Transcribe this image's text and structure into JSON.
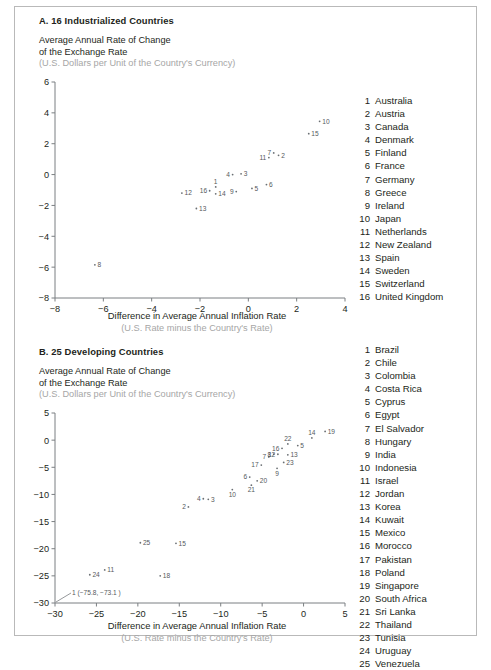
{
  "figure": {
    "panels": [
      {
        "id": "A",
        "title": "A. 16 Industrialized Countries",
        "ylabel_line1": "Average Annual Rate of Change",
        "ylabel_line2": "of the Exchange Rate",
        "ylabel_sub": "(U.S. Dollars per Unit of the Country's Currency)",
        "xlabel": "Difference in Average Annual Inflation Rate",
        "xlabel_sub": "(U.S. Rate minus the Country's Rate)"
      },
      {
        "id": "B",
        "title": "B. 25 Developing Countries",
        "ylabel_line1": "Average Annual Rate of Change",
        "ylabel_line2": "of the Exchange Rate",
        "ylabel_sub": "(U.S. Dollars per Unit of the Country's Currency)",
        "xlabel": "Difference in Average Annual Inflation Rate",
        "xlabel_sub": "(U.S. Rate minus the Country's Rate)"
      }
    ]
  },
  "chart_data": [
    {
      "type": "scatter",
      "title": "A. 16 Industrialized Countries",
      "xlabel": "Difference in Average Annual Inflation Rate",
      "xlabel_sub": "(U.S. Rate minus the Country's Rate)",
      "ylabel": "Average Annual Rate of Change of the Exchange Rate",
      "ylabel_sub": "(U.S. Dollars per Unit of the Country's Currency)",
      "xlim": [
        -8,
        4
      ],
      "ylim": [
        -8,
        6
      ],
      "xticks": [
        -8,
        -6,
        -4,
        -2,
        0,
        2,
        4
      ],
      "yticks": [
        -8,
        -6,
        -4,
        -2,
        0,
        2,
        4,
        6
      ],
      "grid": false,
      "legend_position": "right",
      "points": [
        {
          "id": 1,
          "name": "Australia",
          "x": -1.35,
          "y": -0.8,
          "label_pos": "above"
        },
        {
          "id": 2,
          "name": "Austria",
          "x": 1.25,
          "y": 1.25,
          "label_pos": "right"
        },
        {
          "id": 3,
          "name": "Canada",
          "x": -0.3,
          "y": 0.05,
          "label_pos": "right"
        },
        {
          "id": 4,
          "name": "Denmark",
          "x": -0.65,
          "y": 0.0,
          "label_pos": "left"
        },
        {
          "id": 5,
          "name": "Finland",
          "x": 0.15,
          "y": -0.9,
          "label_pos": "right"
        },
        {
          "id": 6,
          "name": "France",
          "x": 0.75,
          "y": -0.65,
          "label_pos": "right"
        },
        {
          "id": 7,
          "name": "Germany",
          "x": 1.05,
          "y": 1.4,
          "label_pos": "left"
        },
        {
          "id": 8,
          "name": "Greece",
          "x": -6.35,
          "y": -5.85,
          "label_pos": "right"
        },
        {
          "id": 9,
          "name": "Ireland",
          "x": -0.5,
          "y": -1.1,
          "label_pos": "left"
        },
        {
          "id": 10,
          "name": "Japan",
          "x": 2.95,
          "y": 3.45,
          "label_pos": "right"
        },
        {
          "id": 11,
          "name": "Netherlands",
          "x": 0.85,
          "y": 1.1,
          "label_pos": "left"
        },
        {
          "id": 12,
          "name": "New Zealand",
          "x": -2.75,
          "y": -1.2,
          "label_pos": "right"
        },
        {
          "id": 13,
          "name": "Spain",
          "x": -2.15,
          "y": -2.2,
          "label_pos": "right"
        },
        {
          "id": 14,
          "name": "Sweden",
          "x": -1.35,
          "y": -1.25,
          "label_pos": "right"
        },
        {
          "id": 15,
          "name": "Switzerland",
          "x": 2.5,
          "y": 2.65,
          "label_pos": "right"
        },
        {
          "id": 16,
          "name": "United Kingdom",
          "x": -1.6,
          "y": -1.05,
          "label_pos": "left"
        }
      ]
    },
    {
      "type": "scatter",
      "title": "B. 25 Developing Countries",
      "xlabel": "Difference in Average Annual Inflation Rate",
      "xlabel_sub": "(U.S. Rate minus the Country's Rate)",
      "ylabel": "Average Annual Rate of Change of the Exchange Rate",
      "ylabel_sub": "(U.S. Dollars per Unit of the Country's Currency)",
      "xlim": [
        -30,
        5
      ],
      "ylim": [
        -30,
        5
      ],
      "xticks": [
        -30,
        -25,
        -20,
        -15,
        -10,
        -5,
        0,
        5
      ],
      "yticks": [
        -30,
        -25,
        -20,
        -15,
        -10,
        -5,
        0,
        5
      ],
      "grid": false,
      "legend_position": "right",
      "annotation": {
        "text": "1 (−75.8, −73.1 )",
        "target_x": -30,
        "target_y": -30
      },
      "points": [
        {
          "id": 1,
          "name": "Brazil",
          "x": -30.0,
          "y": -30.0,
          "label_pos": "offscreen"
        },
        {
          "id": 2,
          "name": "Chile",
          "x": -13.9,
          "y": -12.3,
          "label_pos": "left"
        },
        {
          "id": 3,
          "name": "Colombia",
          "x": -11.5,
          "y": -10.9,
          "label_pos": "right"
        },
        {
          "id": 4,
          "name": "Costa Rica",
          "x": -12.1,
          "y": -10.8,
          "label_pos": "left"
        },
        {
          "id": 5,
          "name": "Cyprus",
          "x": -0.7,
          "y": -1.0,
          "label_pos": "right"
        },
        {
          "id": 6,
          "name": "Egypt",
          "x": -6.5,
          "y": -6.8,
          "label_pos": "left"
        },
        {
          "id": 7,
          "name": "El Salvador",
          "x": -4.2,
          "y": -3.1,
          "label_pos": "left"
        },
        {
          "id": 8,
          "name": "Hungary",
          "x": -3.6,
          "y": -2.6,
          "label_pos": "left"
        },
        {
          "id": 9,
          "name": "India",
          "x": -3.2,
          "y": -5.2,
          "label_pos": "below"
        },
        {
          "id": 10,
          "name": "Indonesia",
          "x": -8.6,
          "y": -9.1,
          "label_pos": "below"
        },
        {
          "id": 11,
          "name": "Israel",
          "x": -24.0,
          "y": -23.9,
          "label_pos": "right"
        },
        {
          "id": 12,
          "name": "Jordan",
          "x": -3.1,
          "y": -2.6,
          "label_pos": "left"
        },
        {
          "id": 13,
          "name": "Korea",
          "x": -1.9,
          "y": -2.7,
          "label_pos": "right"
        },
        {
          "id": 14,
          "name": "Kuwait",
          "x": 1.0,
          "y": 0.4,
          "label_pos": "above"
        },
        {
          "id": 15,
          "name": "Mexico",
          "x": -15.4,
          "y": -19.0,
          "label_pos": "right"
        },
        {
          "id": 16,
          "name": "Morocco",
          "x": -2.6,
          "y": -1.5,
          "label_pos": "left"
        },
        {
          "id": 17,
          "name": "Pakistan",
          "x": -5.1,
          "y": -4.6,
          "label_pos": "left"
        },
        {
          "id": 18,
          "name": "Poland",
          "x": -17.3,
          "y": -25.0,
          "label_pos": "right"
        },
        {
          "id": 19,
          "name": "Singapore",
          "x": 2.6,
          "y": 1.6,
          "label_pos": "right"
        },
        {
          "id": 20,
          "name": "South Africa",
          "x": -5.6,
          "y": -7.5,
          "label_pos": "right"
        },
        {
          "id": 21,
          "name": "Sri Lanka",
          "x": -6.3,
          "y": -8.3,
          "label_pos": "below"
        },
        {
          "id": 22,
          "name": "Thailand",
          "x": -1.9,
          "y": -0.7,
          "label_pos": "above"
        },
        {
          "id": 23,
          "name": "Tunisia",
          "x": -2.4,
          "y": -4.1,
          "label_pos": "right"
        },
        {
          "id": 24,
          "name": "Uruguay",
          "x": -25.8,
          "y": -24.8,
          "label_pos": "right"
        },
        {
          "id": 25,
          "name": "Venezuela",
          "x": -19.7,
          "y": -18.9,
          "label_pos": "right"
        }
      ]
    }
  ]
}
